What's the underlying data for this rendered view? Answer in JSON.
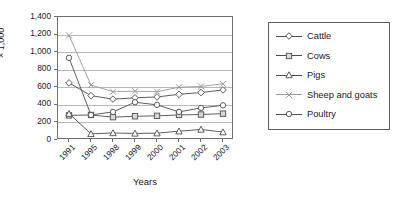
{
  "chart_data": {
    "type": "line",
    "title": "",
    "xlabel": "Years",
    "ylabel": "× 1,000",
    "categories": [
      "1991",
      "1995",
      "1998",
      "1999",
      "2000",
      "2001",
      "2002",
      "2003"
    ],
    "ylim": [
      0,
      1400
    ],
    "ytick_labels": [
      "0",
      "200",
      "400",
      "600",
      "800",
      "1,000",
      "1,200",
      "1,400"
    ],
    "ytick_values": [
      0,
      200,
      400,
      600,
      800,
      1000,
      1200,
      1400
    ],
    "grid": "horizontal",
    "legend_position": "right",
    "series": [
      {
        "name": "Cattle",
        "marker": "diamond",
        "color": "#4d4d4d",
        "values": [
          650,
          505,
          465,
          480,
          490,
          520,
          540,
          570
        ]
      },
      {
        "name": "Cows",
        "marker": "square",
        "color": "#4d4d4d",
        "values": [
          280,
          285,
          260,
          270,
          275,
          285,
          290,
          300
        ]
      },
      {
        "name": "Pigs",
        "marker": "triangle",
        "color": "#4d4d4d",
        "values": [
          300,
          70,
          80,
          75,
          78,
          100,
          120,
          90
        ]
      },
      {
        "name": "Sheep and goats",
        "marker": "x",
        "color": "#9a9a9a",
        "values": [
          1190,
          625,
          550,
          555,
          550,
          600,
          610,
          640
        ]
      },
      {
        "name": "Poultry",
        "marker": "circle",
        "color": "#4d4d4d",
        "values": [
          935,
          285,
          320,
          430,
          400,
          320,
          365,
          395
        ]
      }
    ]
  },
  "axes": {
    "y_title": "× 1,000",
    "x_title": "Years"
  },
  "legend": {
    "items": [
      {
        "label": "Cattle"
      },
      {
        "label": "Cows"
      },
      {
        "label": "Pigs"
      },
      {
        "label": "Sheep and goats"
      },
      {
        "label": "Poultry"
      }
    ]
  }
}
